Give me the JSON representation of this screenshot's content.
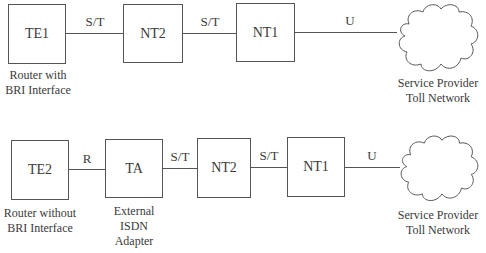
{
  "diagram": {
    "rows": [
      {
        "nodes": [
          {
            "id": "te1",
            "label": "TE1",
            "caption": [
              "Router with",
              "BRI Interface"
            ]
          },
          {
            "id": "nt2",
            "label": "NT2",
            "caption": []
          },
          {
            "id": "nt1",
            "label": "NT1",
            "caption": []
          },
          {
            "id": "cloud",
            "label": "",
            "caption": [
              "Service Provider",
              "Toll Network"
            ]
          }
        ],
        "links": [
          {
            "from": "te1",
            "to": "nt2",
            "label": "S/T"
          },
          {
            "from": "nt2",
            "to": "nt1",
            "label": "S/T"
          },
          {
            "from": "nt1",
            "to": "cloud",
            "label": "U"
          }
        ]
      },
      {
        "nodes": [
          {
            "id": "te2",
            "label": "TE2",
            "caption": [
              "Router without",
              "BRI Interface"
            ]
          },
          {
            "id": "ta",
            "label": "TA",
            "caption": [
              "External",
              "ISDN",
              "Adapter"
            ]
          },
          {
            "id": "nt2",
            "label": "NT2",
            "caption": []
          },
          {
            "id": "nt1",
            "label": "NT1",
            "caption": []
          },
          {
            "id": "cloud",
            "label": "",
            "caption": [
              "Service Provider",
              "Toll Network"
            ]
          }
        ],
        "links": [
          {
            "from": "te2",
            "to": "ta",
            "label": "R"
          },
          {
            "from": "ta",
            "to": "nt2",
            "label": "S/T"
          },
          {
            "from": "nt2",
            "to": "nt1",
            "label": "S/T"
          },
          {
            "from": "nt1",
            "to": "cloud",
            "label": "U"
          }
        ]
      }
    ],
    "colors": {
      "stroke": "#555555",
      "text": "#3a3a3a",
      "background": "#ffffff"
    }
  }
}
